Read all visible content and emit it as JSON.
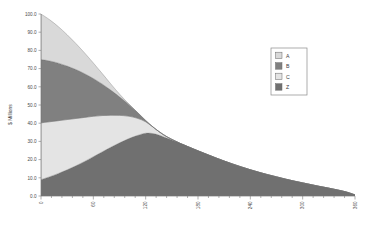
{
  "chart_data": {
    "type": "area",
    "stacked": true,
    "title": "",
    "xlabel": "",
    "ylabel": "$ Millions",
    "xlim": [
      0,
      360
    ],
    "ylim": [
      0,
      100
    ],
    "grid": false,
    "legend_position": "right",
    "x_ticks": [
      0,
      60,
      120,
      180,
      240,
      300,
      360
    ],
    "x_tick_labels": [
      "0",
      "60",
      "120",
      "180",
      "240",
      "300",
      "360"
    ],
    "y_ticks": [
      0,
      10,
      20,
      30,
      40,
      50,
      60,
      70,
      80,
      90,
      100
    ],
    "y_tick_labels": [
      "0.0",
      "10.0",
      "20.0",
      "30.0",
      "40.0",
      "50.0",
      "60.0",
      "70.0",
      "80.0",
      "90.0",
      "100.0"
    ],
    "x": [
      0,
      10,
      20,
      30,
      40,
      50,
      60,
      70,
      80,
      90,
      100,
      110,
      120,
      130,
      140,
      150,
      160,
      170,
      180,
      190,
      200,
      210,
      220,
      230,
      240,
      250,
      260,
      270,
      280,
      290,
      300,
      310,
      320,
      330,
      340,
      350,
      360
    ],
    "series": [
      {
        "name": "Z",
        "color": "#707070",
        "order": 1,
        "values": [
          9.0,
          10.6,
          12.4,
          14.4,
          16.6,
          19.0,
          21.6,
          24.2,
          26.8,
          29.2,
          31.4,
          33.2,
          34.5,
          34.2,
          32.6,
          30.8,
          28.8,
          26.8,
          24.8,
          22.9,
          21.0,
          19.2,
          17.5,
          15.9,
          14.4,
          13.0,
          11.7,
          10.5,
          9.3,
          8.2,
          7.2,
          6.2,
          5.2,
          4.3,
          3.3,
          2.2,
          0.6
        ]
      },
      {
        "name": "C",
        "color": "#e4e4e4",
        "order": 2,
        "values": [
          31.2,
          30.2,
          29.0,
          27.6,
          26.0,
          24.2,
          22.2,
          20.0,
          17.6,
          15.1,
          12.5,
          9.6,
          6.3,
          3.1,
          1.2,
          0.3,
          0.0,
          0.0,
          0.0,
          0.0,
          0.0,
          0.0,
          0.0,
          0.0,
          0.0,
          0.0,
          0.0,
          0.0,
          0.0,
          0.0,
          0.0,
          0.0,
          0.0,
          0.0,
          0.0,
          0.0,
          0.0
        ]
      },
      {
        "name": "B",
        "color": "#808080",
        "order": 3,
        "values": [
          34.8,
          33.4,
          31.6,
          29.4,
          26.9,
          24.0,
          20.8,
          17.4,
          13.8,
          10.2,
          6.7,
          3.4,
          0.7,
          0.0,
          0.0,
          0.0,
          0.0,
          0.0,
          0.0,
          0.0,
          0.0,
          0.0,
          0.0,
          0.0,
          0.0,
          0.0,
          0.0,
          0.0,
          0.0,
          0.0,
          0.0,
          0.0,
          0.0,
          0.0,
          0.0,
          0.0,
          0.0
        ]
      },
      {
        "name": "A",
        "color": "#d9d9d9",
        "order": 4,
        "values": [
          25.0,
          22.6,
          20.0,
          17.2,
          14.3,
          11.4,
          8.5,
          5.8,
          3.4,
          1.5,
          0.3,
          0.0,
          0.0,
          0.0,
          0.0,
          0.0,
          0.0,
          0.0,
          0.0,
          0.0,
          0.0,
          0.0,
          0.0,
          0.0,
          0.0,
          0.0,
          0.0,
          0.0,
          0.0,
          0.0,
          0.0,
          0.0,
          0.0,
          0.0,
          0.0,
          0.0,
          0.0
        ]
      }
    ],
    "totals": [
      100.0,
      96.8,
      93.0,
      88.6,
      83.8,
      78.6,
      73.1,
      67.4,
      61.6,
      56.0,
      50.9,
      46.2,
      41.5,
      37.3,
      33.8,
      31.1,
      28.8,
      26.8,
      24.8,
      22.9,
      21.0,
      19.2,
      17.5,
      15.9,
      14.4,
      13.0,
      11.7,
      10.5,
      9.3,
      8.2,
      7.2,
      6.2,
      5.2,
      4.3,
      3.3,
      2.2,
      0.6
    ]
  },
  "legend": {
    "entries": [
      {
        "label": "A",
        "color": "#d9d9d9"
      },
      {
        "label": "B",
        "color": "#808080"
      },
      {
        "label": "C",
        "color": "#e4e4e4"
      },
      {
        "label": "Z",
        "color": "#707070"
      }
    ]
  },
  "axes": {
    "y_title": "$ Millions"
  }
}
